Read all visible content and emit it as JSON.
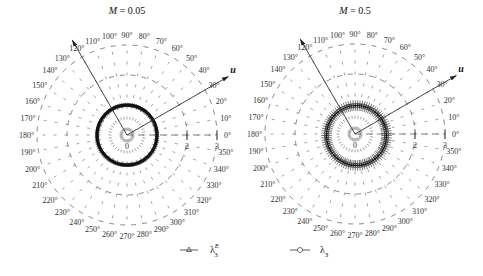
{
  "chart_data": [
    {
      "type": "polar",
      "title": "M = 0.05",
      "center_px": [
        127,
        135
      ],
      "unit_px": 30,
      "radial_ticks": [
        0,
        1,
        2,
        3
      ],
      "radial_tick_labels_shown": [
        "0",
        "2",
        "3"
      ],
      "angle_ticks_deg": [
        0,
        10,
        20,
        30,
        40,
        50,
        60,
        70,
        80,
        90,
        100,
        110,
        120,
        130,
        140,
        150,
        160,
        170,
        180,
        190,
        200,
        210,
        220,
        230,
        240,
        250,
        260,
        270,
        280,
        290,
        300,
        310,
        320,
        330,
        340,
        350
      ],
      "arrows": [
        {
          "angle_deg": 30,
          "label": "u"
        },
        {
          "angle_deg": 120,
          "label": ""
        }
      ],
      "series": [
        {
          "name": "λ3^E",
          "marker": "triangle",
          "shape": "circle",
          "radius": 1.0,
          "offset": [
            0,
            0
          ],
          "thickness": 0.1
        }
      ]
    },
    {
      "type": "polar",
      "title": "M = 0.5",
      "center_px": [
        355,
        134
      ],
      "unit_px": 30,
      "radial_ticks": [
        0,
        1,
        2,
        3
      ],
      "radial_tick_labels_shown": [
        "0",
        "2",
        "3"
      ],
      "angle_ticks_deg": [
        0,
        10,
        20,
        30,
        40,
        50,
        60,
        70,
        80,
        90,
        100,
        110,
        120,
        130,
        140,
        150,
        160,
        170,
        180,
        190,
        200,
        210,
        220,
        230,
        240,
        250,
        260,
        270,
        280,
        290,
        300,
        310,
        320,
        330,
        340,
        350
      ],
      "arrows": [
        {
          "angle_deg": 30,
          "label": "u"
        },
        {
          "angle_deg": 120,
          "label": ""
        }
      ],
      "series": [
        {
          "name": "λ3",
          "marker": "circle",
          "shape": "circle",
          "radius": 1.0,
          "offset": [
            0.05,
            -0.05
          ],
          "thickness": 0.35
        }
      ]
    }
  ],
  "legend": [
    {
      "symbol": "triangle",
      "label": "λ",
      "sup": "E",
      "sub": "3"
    },
    {
      "symbol": "circle",
      "label": "λ",
      "sub": "3"
    }
  ]
}
